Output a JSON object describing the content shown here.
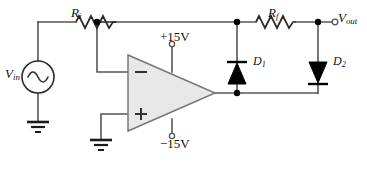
{
  "diagram": {
    "colors": {
      "wire": "#555555",
      "component_outline": "#444444",
      "opamp_fill": "#e8e8e8",
      "diode_fill": "#000000",
      "node_dot": "#000000",
      "text": "#111111",
      "background": "#ffffff"
    },
    "labels": {
      "input_resistor": {
        "symbol": "R",
        "subscript": "i"
      },
      "feedback_resistor": {
        "symbol": "R",
        "subscript": "f"
      },
      "input_source": {
        "symbol": "V",
        "subscript": "in"
      },
      "output_terminal": {
        "symbol": "V",
        "subscript": "out"
      },
      "diode_1": {
        "symbol": "D",
        "subscript": "1"
      },
      "diode_2": {
        "symbol": "D",
        "subscript": "2"
      },
      "supply_positive": "+15V",
      "supply_negative": "−15V",
      "opamp_inverting_input": "−",
      "opamp_noninverting_input": "+"
    },
    "components": [
      {
        "name": "input-source",
        "type": "ac-voltage-source",
        "label": "V_in"
      },
      {
        "name": "input-resistor",
        "type": "resistor",
        "label": "R_i"
      },
      {
        "name": "feedback-resistor",
        "type": "resistor",
        "label": "R_f"
      },
      {
        "name": "opamp",
        "type": "operational-amplifier",
        "supplies": [
          "+15V",
          "−15V"
        ]
      },
      {
        "name": "diode-1",
        "type": "diode",
        "label": "D_1",
        "orientation": "cathode-up"
      },
      {
        "name": "diode-2",
        "type": "diode",
        "label": "D_2",
        "orientation": "cathode-down"
      },
      {
        "name": "source-ground",
        "type": "ground"
      },
      {
        "name": "noninverting-ground",
        "type": "ground"
      },
      {
        "name": "output-terminal",
        "type": "open-terminal",
        "label": "V_out"
      },
      {
        "name": "supply-positive-terminal",
        "type": "open-terminal",
        "label": "+15V"
      },
      {
        "name": "supply-negative-terminal",
        "type": "open-terminal",
        "label": "−15V"
      }
    ]
  }
}
